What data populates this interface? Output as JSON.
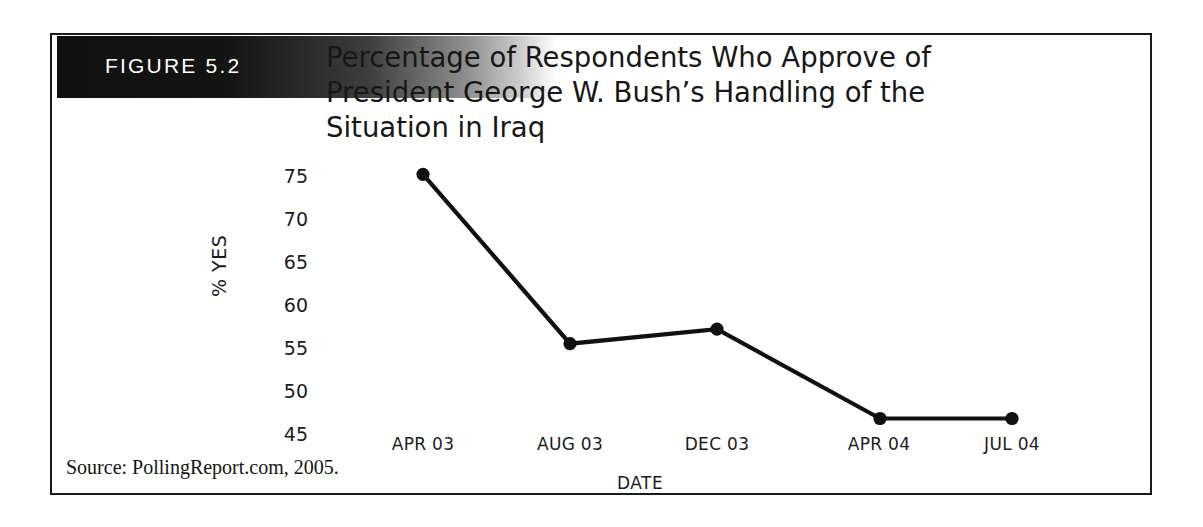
{
  "figure": {
    "label": "FIGURE 5.2",
    "title_lines": [
      "Percentage of Respondents Who Approve of",
      "President George W. Bush’s Handling of the",
      "Situation in Iraq"
    ],
    "source": "Source: PollingReport.com, 2005."
  },
  "colors": {
    "line": "#111111",
    "marker": "#111111",
    "text": "#1c1c1c",
    "border": "#1b1b1b",
    "band_dark": "#101010",
    "background": "#ffffff"
  },
  "chart_data": {
    "type": "line",
    "title": "Percentage of Respondents Who Approve of President George W. Bush’s Handling of the Situation in Iraq",
    "xlabel": "DATE",
    "ylabel": "% YES",
    "categories": [
      "APR 03",
      "AUG 03",
      "DEC 03",
      "APR 04",
      "JUL 04"
    ],
    "values": [
      75.2,
      55.5,
      57.2,
      46.8,
      46.8
    ],
    "series": [
      {
        "name": "% YES",
        "values": [
          75.2,
          55.5,
          57.2,
          46.8,
          46.8
        ]
      }
    ],
    "ylim": [
      43.5,
      76.5
    ],
    "yticks": [
      75,
      70,
      65,
      60,
      55,
      50,
      45
    ],
    "ytick_labels": [
      "75",
      "70",
      "65",
      "60",
      "55",
      "50",
      "45"
    ],
    "xtick_labels": [
      "APR 03",
      "AUG 03",
      "DEC 03",
      "APR 04",
      "JUL 04"
    ],
    "grid": false,
    "legend": "none",
    "marker": "circle",
    "source": "Source: PollingReport.com, 2005."
  }
}
